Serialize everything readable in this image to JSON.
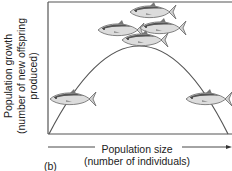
{
  "figure": {
    "panel_label": "(b)",
    "y_axis": {
      "line1": "Population growth",
      "line2": "(number of new offspring",
      "line3": "produced)"
    },
    "x_axis": {
      "line1": "Population size",
      "line2": "(number of individuals)"
    },
    "curve": "hump-shaped (parabolic) relationship: growth low at small and large population sizes, maximal at intermediate size",
    "icons": [
      "fish-icon",
      "fish-icon",
      "fish-school-icon"
    ],
    "colors": {
      "line": "#555555",
      "fish_body": "#d8d8d8",
      "fish_dark": "#555555",
      "background": "#ffffff"
    }
  }
}
